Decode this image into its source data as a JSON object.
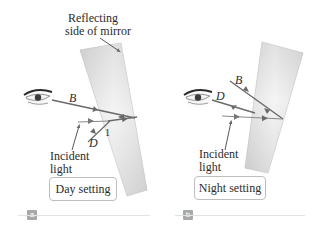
{
  "panels": {
    "a": {
      "tag": "a",
      "mirror_label_line1": "Reflecting",
      "mirror_label_line2": "side of mirror",
      "ray_labels": {
        "B": "B",
        "D": "D",
        "one": "1"
      },
      "incident_line1": "Incident",
      "incident_line2": "light",
      "setting": "Day setting"
    },
    "b": {
      "tag": "b",
      "ray_labels": {
        "B": "B",
        "D": "D"
      },
      "incident_line1": "Incident",
      "incident_line2": "light",
      "setting": "Night setting"
    }
  },
  "colors": {
    "ray": "#6a6a6a",
    "mirror_light": "#f2f2f2",
    "mirror_dark": "#c4c4c4",
    "tag_bg": "#a8a8a8",
    "rule": "#e2e2e2"
  }
}
